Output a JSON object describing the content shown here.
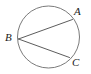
{
  "figure": {
    "kind": "circle-inscribed-angle-diagram",
    "background_color": "#ffffff",
    "stroke_color": "#6b6b6b",
    "chord_color": "#4a4a4a",
    "label_color": "#1a1a1a",
    "circle": {
      "center_x": 48.5,
      "center_y": 37,
      "radius": 31,
      "stroke_width": 0.9
    },
    "points": [
      {
        "id": "A",
        "label": "A",
        "x": 72.5,
        "y": 19.5,
        "label_x": 74,
        "label_y": 6
      },
      {
        "id": "B",
        "label": "B",
        "x": 18.5,
        "y": 39.0,
        "label_x": 5,
        "label_y": 32
      },
      {
        "id": "C",
        "label": "C",
        "x": 69.5,
        "y": 57.5,
        "label_x": 72,
        "label_y": 57
      }
    ],
    "chords": [
      {
        "id": "BA",
        "from": "B",
        "to": "A",
        "x1": 18.5,
        "y1": 39.0,
        "x2": 72.5,
        "y2": 19.5,
        "stroke_width": 0.9
      },
      {
        "id": "BC",
        "from": "B",
        "to": "C",
        "x1": 18.5,
        "y1": 39.0,
        "x2": 69.5,
        "y2": 57.5,
        "stroke_width": 0.9
      }
    ],
    "labels": {
      "a": "A",
      "b": "B",
      "c": "C"
    }
  }
}
